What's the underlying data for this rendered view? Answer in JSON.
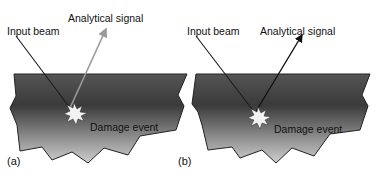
{
  "panels": [
    {
      "id": "a",
      "label": "(a)",
      "input_label": "Input beam",
      "signal_label": "Analytical signal",
      "event_label": "Damage event",
      "signal_color": "#9a9a9a"
    },
    {
      "id": "b",
      "label": "(b)",
      "input_label": "Input beam",
      "signal_label": "Analytical signal",
      "event_label": "Damage event",
      "signal_color": "#111111"
    }
  ],
  "colors": {
    "sample_top": "#4a4a4a",
    "sample_mid": "#3a3a3a",
    "sample_bottom": "#c8c8c8",
    "outline": "#222222",
    "starburst": "#f2f2f2"
  }
}
